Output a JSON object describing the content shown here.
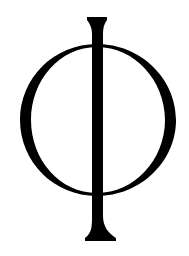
{
  "image": {
    "symbol": "Φ",
    "symbol_name": "phi-symbol",
    "background": "#ffffff",
    "ink": "#000000"
  }
}
